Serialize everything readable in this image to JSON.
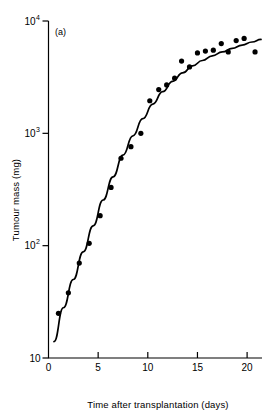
{
  "figure": {
    "panel_label": "(a)",
    "background_color": "#ffffff",
    "ink_color": "#000000"
  },
  "chart_data": {
    "type": "scatter",
    "title": "",
    "subtitle": "",
    "panel": "(a)",
    "xlabel": "Time after transplantation (days)",
    "ylabel": "Tumour mass (mg)",
    "xlim": [
      0,
      21.5
    ],
    "ylim": [
      10,
      10000
    ],
    "yscale": "log",
    "xscale": "linear",
    "grid": false,
    "legend": null,
    "legend_position": "none",
    "xticks": [
      0,
      5,
      10,
      15,
      20
    ],
    "xtick_labels": [
      "0",
      "5",
      "10",
      "15",
      "20"
    ],
    "yticks": [
      10,
      100,
      1000,
      10000
    ],
    "ytick_labels": [
      "10",
      "10²",
      "10³",
      "10⁴"
    ],
    "ytick_mantissa": [
      "10",
      "10",
      "10",
      "10"
    ],
    "ytick_exponents": [
      "",
      "2",
      "3",
      "4"
    ],
    "marker": "filled-circle",
    "marker_size_px": 4.6,
    "series": [
      {
        "name": "Tumour mass observations",
        "marker": "filled-circle",
        "color": "#000000",
        "points": [
          {
            "x": 1.0,
            "y": 25
          },
          {
            "x": 2.0,
            "y": 38
          },
          {
            "x": 3.1,
            "y": 70
          },
          {
            "x": 4.1,
            "y": 105
          },
          {
            "x": 5.2,
            "y": 185
          },
          {
            "x": 6.3,
            "y": 330
          },
          {
            "x": 7.3,
            "y": 600
          },
          {
            "x": 8.3,
            "y": 760
          },
          {
            "x": 9.3,
            "y": 1000
          },
          {
            "x": 10.2,
            "y": 1950
          },
          {
            "x": 11.1,
            "y": 2450
          },
          {
            "x": 11.9,
            "y": 2700
          },
          {
            "x": 12.7,
            "y": 3100
          },
          {
            "x": 13.4,
            "y": 4400
          },
          {
            "x": 14.2,
            "y": 3900
          },
          {
            "x": 15.0,
            "y": 5200
          },
          {
            "x": 15.8,
            "y": 5400
          },
          {
            "x": 16.6,
            "y": 5500
          },
          {
            "x": 17.4,
            "y": 6300
          },
          {
            "x": 18.1,
            "y": 5300
          },
          {
            "x": 18.9,
            "y": 6700
          },
          {
            "x": 19.7,
            "y": 7000
          },
          {
            "x": 20.8,
            "y": 5300
          }
        ]
      }
    ],
    "fitted_curve": {
      "name": "Gompertz fit",
      "style": "solid",
      "color": "#000000",
      "points": [
        {
          "x": 0.55,
          "y": 14
        },
        {
          "x": 1.5,
          "y": 28
        },
        {
          "x": 2.5,
          "y": 50
        },
        {
          "x": 3.5,
          "y": 88
        },
        {
          "x": 4.5,
          "y": 150
        },
        {
          "x": 5.5,
          "y": 255
        },
        {
          "x": 6.5,
          "y": 410
        },
        {
          "x": 7.5,
          "y": 640
        },
        {
          "x": 8.5,
          "y": 950
        },
        {
          "x": 9.5,
          "y": 1350
        },
        {
          "x": 10.5,
          "y": 1820
        },
        {
          "x": 11.5,
          "y": 2350
        },
        {
          "x": 12.5,
          "y": 2900
        },
        {
          "x": 13.5,
          "y": 3450
        },
        {
          "x": 14.5,
          "y": 3980
        },
        {
          "x": 15.5,
          "y": 4450
        },
        {
          "x": 16.5,
          "y": 4900
        },
        {
          "x": 17.5,
          "y": 5300
        },
        {
          "x": 18.5,
          "y": 5700
        },
        {
          "x": 19.5,
          "y": 6100
        },
        {
          "x": 20.5,
          "y": 6500
        },
        {
          "x": 21.4,
          "y": 6850
        }
      ]
    }
  }
}
